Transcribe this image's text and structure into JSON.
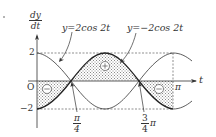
{
  "diagram": {
    "y_axis_label_num": "dy",
    "y_axis_label_den": "dt",
    "x_axis_label": "t",
    "origin_label": "O",
    "tick_y_pos": "2",
    "tick_y_neg": "−2",
    "tick_x_pi": "π",
    "tick_x_quarter_num": "π",
    "tick_x_quarter_den": "4",
    "tick_x_threequarter_num": "3",
    "tick_x_threequarter_den": "4",
    "tick_x_threequarter_suffix": "π",
    "curve_labels": [
      {
        "text": "y=2cos 2t"
      },
      {
        "text": "y=−2cos 2t"
      }
    ],
    "region_signs": [
      {
        "sign": "⊕",
        "region": "between π/4 and 3π/4"
      },
      {
        "sign": "⊖",
        "region": "between 0 and π/4"
      },
      {
        "sign": "⊖",
        "region": "between 3π/4 and π"
      }
    ],
    "colors": {
      "line": "#333333",
      "hatch": "#9a9a9a",
      "background": "#ffffff"
    }
  }
}
